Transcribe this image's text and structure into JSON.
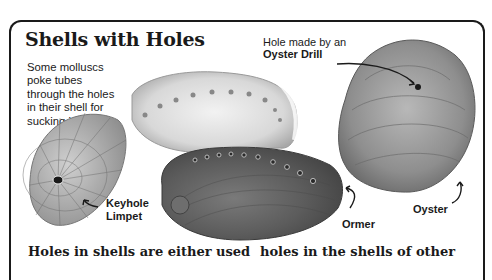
{
  "page": {
    "title": "Shells with Holes",
    "intro_lines": [
      "Some molluscs",
      "poke tubes",
      "through the holes",
      "in their shell for",
      "sucking in water."
    ],
    "callout": {
      "line1": "Hole made by an",
      "line2": "Oyster Drill"
    },
    "labels": {
      "keyhole_limpet_line1": "Keyhole",
      "keyhole_limpet_line2": "Limpet",
      "ormer": "Ormer",
      "oyster": "Oyster"
    },
    "body_columns": {
      "left": "Holes in shells are either used",
      "right": "holes in the shells of other"
    },
    "illustrations": [
      {
        "name": "keyhole-limpet-shell",
        "tone": "light grey ribbed cone"
      },
      {
        "name": "ormer-shell-inside",
        "tone": "pale pearly interior"
      },
      {
        "name": "ormer-shell-outside",
        "tone": "dark grey with row of holes"
      },
      {
        "name": "oyster-shell",
        "tone": "grey rough ridged shell with drill hole"
      }
    ],
    "colors": {
      "ink": "#1a1a1a",
      "paper": "#ffffff"
    }
  }
}
